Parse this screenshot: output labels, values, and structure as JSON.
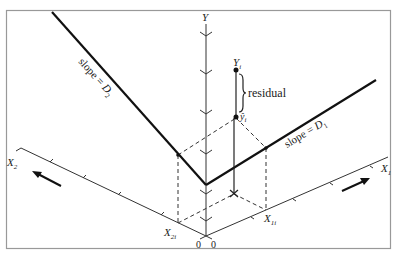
{
  "figure": {
    "colors": {
      "line": "#1a1a1a",
      "frame": "#999999",
      "background": "#ffffff"
    }
  },
  "axes": {
    "y_label": "Y",
    "x1_label": "X",
    "x1_sub": "1",
    "x2_label": "X",
    "x2_sub": "2",
    "origin_left": "0",
    "origin_right": "0"
  },
  "points": {
    "yi_label": "Y",
    "yi_sub": "i",
    "yhat_label": "ŷ",
    "yhat_sub": "i",
    "x1i_label": "X",
    "x1i_sub": "1i",
    "x2i_label": "X",
    "x2i_sub": "2i"
  },
  "annotations": {
    "residual": "residual",
    "slope_d1_prefix": "slope = ",
    "slope_d1_var": "D",
    "slope_d1_sub": "1",
    "slope_d2_prefix": "slope = ",
    "slope_d2_var": "D",
    "slope_d2_sub": "2"
  }
}
